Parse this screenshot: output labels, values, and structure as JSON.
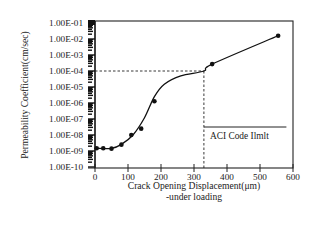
{
  "chart_data": {
    "type": "line",
    "title": "",
    "xlabel": "Crack Opening Displacement(μm)",
    "xlabel_line2": "-under loading",
    "ylabel": "Permeability Coefficient(cm/sec)",
    "yscale": "log",
    "xlim": [
      0,
      600
    ],
    "ylim": [
      1e-10,
      0.1
    ],
    "x_ticks": [
      "0",
      "100",
      "200",
      "300",
      "400",
      "500",
      "600"
    ],
    "y_ticks": [
      "1.00E-01",
      "1.00E-02",
      "1.00E-03",
      "1.00E-04",
      "1.00E-05",
      "1.00E-06",
      "1.00E-07",
      "1.00E-08",
      "1.00E-09",
      "1.00E-10"
    ],
    "grid": false,
    "legend": null,
    "series": [
      {
        "name": "Measured permeability",
        "marker": "circle",
        "x": [
          5,
          25,
          50,
          80,
          110,
          140,
          180,
          355,
          555
        ],
        "y": [
          1.5e-09,
          1.5e-09,
          1.4e-09,
          2.5e-09,
          1e-08,
          2.5e-08,
          1.3e-06,
          0.00027,
          0.016
        ]
      }
    ],
    "annotations": [
      {
        "type": "hline-dashed",
        "y": 0.0001,
        "x_from": 0,
        "x_to": 330
      },
      {
        "type": "vline-dashed",
        "x": 330,
        "y_from": 1e-10,
        "y_to": 0.0001
      },
      {
        "type": "text",
        "text": "ACI Code Ilmlt",
        "x_from": 330,
        "x_to": 580,
        "y": 3e-08
      }
    ]
  }
}
